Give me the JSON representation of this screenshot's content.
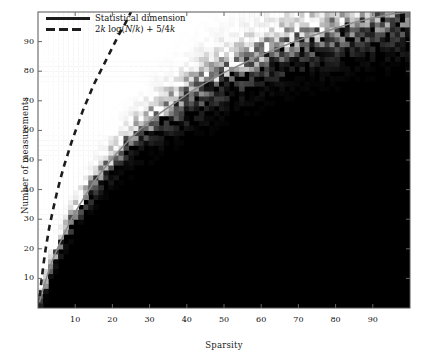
{
  "figure": {
    "kind": "phase-transition-heatmap",
    "background_color": "#ffffff",
    "plot_area": {
      "left": 38,
      "top": 12,
      "right": 410,
      "bottom": 308
    }
  },
  "chart_data": {
    "type": "heatmap",
    "title": "",
    "subtitle": "",
    "xlabel": "Sparsity",
    "ylabel": "Number of measurements",
    "xlim": [
      0,
      100
    ],
    "ylim": [
      0,
      100
    ],
    "xticks": [
      10,
      20,
      30,
      40,
      50,
      60,
      70,
      80,
      90
    ],
    "yticks": [
      10,
      20,
      30,
      40,
      50,
      60,
      70,
      80,
      90
    ],
    "xticklabels": [
      "10",
      "20",
      "30",
      "40",
      "50",
      "60",
      "70",
      "80",
      "90"
    ],
    "yticklabels": [
      "10",
      "20",
      "30",
      "40",
      "50",
      "60",
      "70",
      "80",
      "90"
    ],
    "grid": false,
    "colormap": "gray",
    "colormap_low_color": "#000000",
    "colormap_high_color": "#ffffff",
    "legend": {
      "position": "top-left",
      "entries": [
        {
          "label": "Statistical dimension",
          "style": "solid",
          "color": "#1c1c1c",
          "curve_color_in_plot": "#8a8a8a"
        },
        {
          "label": "2k log(N/k) + 5/4k",
          "label_parts": {
            "a": "2",
            "k1": "k",
            "log": " log(",
            "N": "N",
            "slash": "/",
            "k2": "k",
            "close": ") + 5",
            "slash2": "/",
            "four": "4",
            "k3": "k"
          },
          "style": "dashed",
          "color": "#1c1c1c"
        }
      ]
    },
    "curves": [
      {
        "name": "statistical-dimension",
        "style": "solid",
        "color": "#8a8a8a",
        "points": [
          [
            0.4,
            2
          ],
          [
            1,
            5
          ],
          [
            2,
            9
          ],
          [
            3,
            13
          ],
          [
            4,
            16.5
          ],
          [
            5,
            19.5
          ],
          [
            7,
            25
          ],
          [
            9,
            30
          ],
          [
            11,
            34.5
          ],
          [
            13,
            38.5
          ],
          [
            15,
            42.5
          ],
          [
            18,
            47.5
          ],
          [
            21,
            52
          ],
          [
            25,
            57.5
          ],
          [
            29,
            62
          ],
          [
            33,
            66
          ],
          [
            37,
            69.5
          ],
          [
            41,
            73
          ],
          [
            45,
            76
          ],
          [
            50,
            79.5
          ],
          [
            55,
            82.5
          ],
          [
            60,
            85.5
          ],
          [
            65,
            88
          ],
          [
            70,
            90.5
          ],
          [
            75,
            92.5
          ],
          [
            80,
            94.5
          ],
          [
            85,
            96.5
          ],
          [
            90,
            98
          ],
          [
            95,
            99.3
          ],
          [
            100,
            100
          ]
        ]
      },
      {
        "name": "2k-log-N-over-k-plus-5-4k",
        "style": "dashed",
        "color": "#1c1c1c",
        "points": [
          [
            0.5,
            4
          ],
          [
            1,
            10
          ],
          [
            1.5,
            15
          ],
          [
            2,
            19.5
          ],
          [
            3,
            27
          ],
          [
            4,
            33
          ],
          [
            5,
            38.5
          ],
          [
            6,
            43.5
          ],
          [
            7,
            48
          ],
          [
            8,
            52
          ],
          [
            9,
            56
          ],
          [
            10,
            59.5
          ],
          [
            11,
            63
          ],
          [
            12,
            66.5
          ],
          [
            13,
            69.5
          ],
          [
            14,
            72.5
          ],
          [
            15,
            75.5
          ],
          [
            16,
            78
          ],
          [
            17,
            80.5
          ],
          [
            18,
            83
          ],
          [
            19,
            85.5
          ],
          [
            20,
            88
          ],
          [
            21,
            90.5
          ],
          [
            22,
            93
          ],
          [
            23,
            95
          ],
          [
            24,
            97.5
          ],
          [
            25,
            100
          ]
        ]
      }
    ]
  }
}
